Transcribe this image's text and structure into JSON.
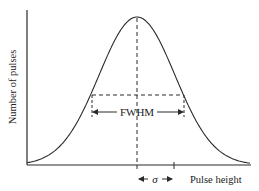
{
  "diagram": {
    "y_axis_label": "Number of pulses",
    "x_axis_label": "Pulse height",
    "fwhm_label": "FWHM",
    "sigma_label": "σ",
    "colors": {
      "line": "#2a2a2a",
      "text": "#222222",
      "background": "#ffffff"
    },
    "curve": {
      "type": "gaussian",
      "peak_x": 137,
      "peak_y": 17,
      "baseline_y": 165,
      "sigma_px": 38
    }
  }
}
